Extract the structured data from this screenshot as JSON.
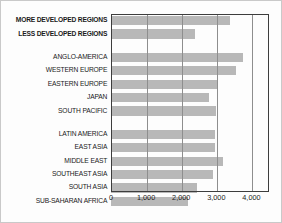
{
  "chart_data": {
    "type": "bar",
    "orientation": "horizontal",
    "title": "",
    "subtitle": "",
    "xlabel": "",
    "ylabel": "",
    "xlim": [
      0,
      4500
    ],
    "xticks": [
      0,
      1000,
      2000,
      3000,
      4000
    ],
    "xtick_labels": [
      "0",
      "1,000",
      "2,000",
      "3,000",
      "4,000"
    ],
    "grid": "vertical",
    "legend": "none",
    "bar_color": "#b8b8b8",
    "categories": [
      "MORE DEVELOPED REGIONS",
      "LESS DEVELOPED REGIONS",
      "ANGLO-AMERICA",
      "WESTERN EUROPE",
      "EASTERN EUROPE",
      "JAPAN",
      "SOUTH PACIFIC",
      "LATIN AMERICA",
      "EAST ASIA",
      "MIDDLE EAST",
      "SOUTHEAST ASIA",
      "SOUTH ASIA",
      "SUB-SAHARAN AFRICA"
    ],
    "values": [
      3400,
      2400,
      3750,
      3550,
      3050,
      2800,
      3000,
      2950,
      2950,
      3200,
      2900,
      2450,
      2200
    ],
    "rows": [
      {
        "label": "MORE DEVELOPED REGIONS",
        "value": 3400,
        "bold": true,
        "gap_after": false
      },
      {
        "label": "LESS DEVELOPED REGIONS",
        "value": 2400,
        "bold": true,
        "gap_after": true
      },
      {
        "label": "ANGLO-AMERICA",
        "value": 3750,
        "bold": false,
        "gap_after": false
      },
      {
        "label": "WESTERN EUROPE",
        "value": 3550,
        "bold": false,
        "gap_after": false
      },
      {
        "label": "EASTERN EUROPE",
        "value": 3050,
        "bold": false,
        "gap_after": false
      },
      {
        "label": "JAPAN",
        "value": 2800,
        "bold": false,
        "gap_after": false
      },
      {
        "label": "SOUTH PACIFIC",
        "value": 3000,
        "bold": false,
        "gap_after": true
      },
      {
        "label": "LATIN AMERICA",
        "value": 2950,
        "bold": false,
        "gap_after": false
      },
      {
        "label": "EAST ASIA",
        "value": 2950,
        "bold": false,
        "gap_after": false
      },
      {
        "label": "MIDDLE EAST",
        "value": 3200,
        "bold": false,
        "gap_after": false
      },
      {
        "label": "SOUTHEAST ASIA",
        "value": 2900,
        "bold": false,
        "gap_after": false
      },
      {
        "label": "SOUTH ASIA",
        "value": 2450,
        "bold": false,
        "gap_after": false
      },
      {
        "label": "SUB-SAHARAN AFRICA",
        "value": 2200,
        "bold": false,
        "gap_after": false
      }
    ]
  }
}
